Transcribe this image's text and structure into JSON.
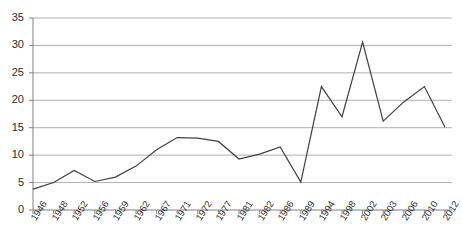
{
  "chart_data": {
    "type": "line",
    "title": "",
    "subtitle": "",
    "xlabel": "",
    "ylabel": "",
    "categories": [
      "1946",
      "1948",
      "1952",
      "1956",
      "1959",
      "1962",
      "1967",
      "1971",
      "1972",
      "1977",
      "1981",
      "1982",
      "1986",
      "1989",
      "1994",
      "1998",
      "2002",
      "2003",
      "2006",
      "2010",
      "2012"
    ],
    "values": [
      3.8,
      5.0,
      7.2,
      5.2,
      6.0,
      8.0,
      11.0,
      13.2,
      13.1,
      12.5,
      9.3,
      10.2,
      11.5,
      5.1,
      22.5,
      17.0,
      30.6,
      16.2,
      19.7,
      22.5,
      15.1
    ],
    "series": [
      {
        "name": "series-1",
        "values": [
          3.8,
          5.0,
          7.2,
          5.2,
          6.0,
          8.0,
          11.0,
          13.2,
          13.1,
          12.5,
          9.3,
          10.2,
          11.5,
          5.1,
          22.5,
          17.0,
          30.6,
          16.2,
          19.7,
          22.5,
          15.1
        ],
        "color": "#3f3f3f"
      }
    ],
    "ylim": [
      0,
      35
    ],
    "ytick_labels": [
      "0",
      "5",
      "10",
      "15",
      "20",
      "25",
      "30",
      "35"
    ],
    "ytick_values": [
      0,
      5,
      10,
      15,
      20,
      25,
      30,
      35
    ],
    "grid": true,
    "grid_color": "#b0b0b0",
    "axis_color": "#808080",
    "legend": null,
    "legend_position": "none"
  }
}
